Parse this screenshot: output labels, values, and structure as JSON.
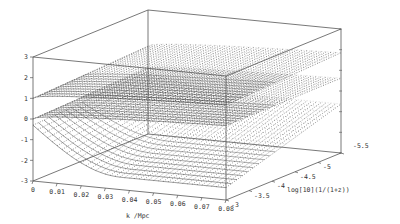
{
  "chart_data": {
    "type": "surface3d",
    "title": "",
    "xlabel": "k /Mpc",
    "ylabel": "log[10](1/(1+z))",
    "zlabel": "",
    "xlim": [
      0,
      0.08
    ],
    "ylim": [
      -3,
      -5.5
    ],
    "zlim": [
      -3,
      3
    ],
    "x_ticks": [
      "0",
      "0.01",
      "0.02",
      "0.03",
      "0.04",
      "0.05",
      "0.06",
      "0.07",
      "0.08"
    ],
    "y_ticks": [
      "-3",
      "-3.5",
      "-4",
      "-4.5",
      "-5",
      "-5.5"
    ],
    "z_ticks": [
      "3",
      "2",
      "1",
      "0",
      "-1",
      "-2",
      "-3"
    ],
    "grid": false,
    "legend": null,
    "series": [
      {
        "name": "upper surface",
        "description": "nearly flat surface at z≈1 at k=0 rising toward ~1.5 at high k; dotted toward large |log a|",
        "z_at_k0": 1.0,
        "z_at_kmax": 1.6
      },
      {
        "name": "middle surface",
        "description": "starts near z≈0 at k=0, curves to ~0.5 at high k",
        "z_at_k0": 0.0,
        "z_at_kmax": 0.6
      },
      {
        "name": "lower surface",
        "description": "starts near z≈-0.3 at k=0, dips to ~-2.3 then flattens near -2.5 at high k",
        "z_at_k0": -0.3,
        "z_at_kmax": -2.4
      }
    ]
  },
  "labels": {
    "xlabel": "k /Mpc",
    "ylabel": "log[10](1/(1+z))"
  }
}
